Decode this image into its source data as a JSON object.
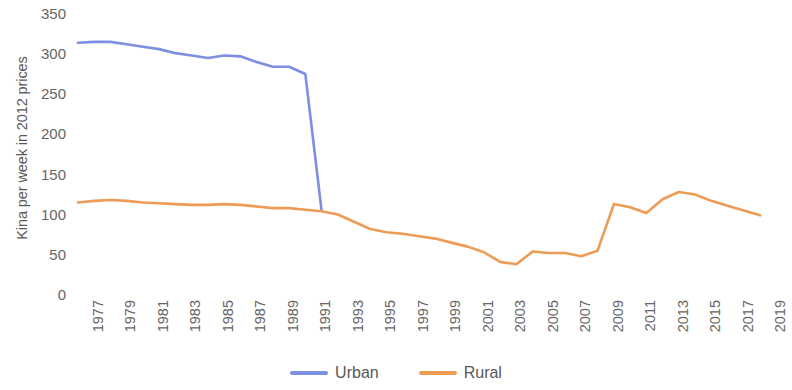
{
  "chart_data": {
    "type": "line",
    "title": "",
    "xlabel": "",
    "ylabel": "Kina per week in 2012 prices",
    "xlim": [
      1977,
      2019
    ],
    "ylim": [
      0,
      350
    ],
    "grid": false,
    "legend_position": "bottom",
    "y_ticks": [
      350,
      300,
      250,
      200,
      150,
      100,
      50,
      0
    ],
    "x_ticks": [
      "1977",
      "1979",
      "1981",
      "1983",
      "1985",
      "1987",
      "1989",
      "1991",
      "1993",
      "1995",
      "1997",
      "1999",
      "2001",
      "2003",
      "2005",
      "2007",
      "2009",
      "2011",
      "2013",
      "2015",
      "2017",
      "2019"
    ],
    "x": [
      1977,
      1978,
      1979,
      1980,
      1981,
      1982,
      1983,
      1984,
      1985,
      1986,
      1987,
      1988,
      1989,
      1990,
      1991,
      1992,
      1993,
      1994,
      1995,
      1996,
      1997,
      1998,
      1999,
      2000,
      2001,
      2002,
      2003,
      2004,
      2005,
      2006,
      2007,
      2008,
      2009,
      2010,
      2011,
      2012,
      2013,
      2014,
      2015,
      2016,
      2017,
      2018,
      2019
    ],
    "series": [
      {
        "name": "Urban",
        "color": "#7c8fe0",
        "values": [
          313,
          314,
          314,
          311,
          308,
          305,
          300,
          297,
          294,
          297,
          296,
          289,
          283,
          283,
          274,
          104,
          null,
          null,
          null,
          null,
          null,
          null,
          null,
          null,
          null,
          null,
          null,
          null,
          null,
          null,
          null,
          null,
          null,
          null,
          null,
          null,
          null,
          null,
          null,
          null,
          null,
          null,
          null
        ]
      },
      {
        "name": "Rural",
        "color": "#ed9b55",
        "values": [
          114,
          116,
          117,
          116,
          114,
          113,
          112,
          111,
          111,
          112,
          111,
          109,
          107,
          107,
          105,
          103,
          99,
          90,
          81,
          77,
          75,
          72,
          69,
          64,
          59,
          52,
          40,
          37,
          53,
          51,
          51,
          47,
          54,
          112,
          108,
          101,
          118,
          127,
          124,
          116,
          110,
          104,
          98
        ]
      }
    ]
  },
  "legend": {
    "entries": [
      {
        "label": "Urban",
        "color": "#7c8fe0"
      },
      {
        "label": "Rural",
        "color": "#ed9b55"
      }
    ]
  }
}
